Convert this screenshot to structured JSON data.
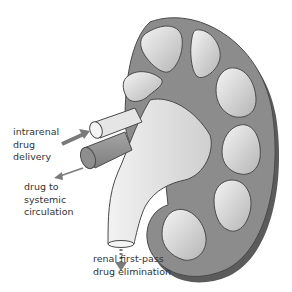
{
  "diagram": {
    "labels": {
      "intrarenal": "intrarenal\ndrug\ndelivery",
      "systemic": "drug to\nsystemic\ncirculation",
      "renal": "renal first-pass\ndrug elimination"
    },
    "arrows": [
      {
        "name": "intrarenal-delivery-arrow",
        "direction": "into artery",
        "style": "solid thick"
      },
      {
        "name": "systemic-circulation-arrow",
        "direction": "out of vein",
        "style": "solid thin"
      },
      {
        "name": "renal-elimination-arrow",
        "direction": "down from ureter",
        "style": "dashed"
      }
    ],
    "colors": {
      "cortex": "#8a8a8a",
      "cortex_shadow": "#5e5e5e",
      "pyramid_light": "#e6e6e6",
      "pyramid_dark": "#b8b8b8",
      "pelvis": "#d9d9d9",
      "outline": "#4a4a4a",
      "arrow": "#7a7a7a",
      "text": "#333333"
    }
  }
}
